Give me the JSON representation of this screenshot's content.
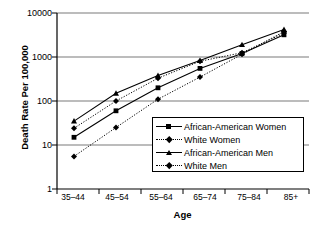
{
  "chart_data": {
    "type": "line",
    "title": "",
    "xlabel": "Age",
    "ylabel": "Death Rate Per 100,000",
    "categories": [
      "35–44",
      "45–54",
      "55–64",
      "65–74",
      "75–84",
      "85+"
    ],
    "yscale": "log",
    "ylim": [
      1,
      10000
    ],
    "ytick_labels": [
      "10000",
      "1000",
      "100",
      "10",
      "1"
    ],
    "ytick_values": [
      10000,
      1000,
      100,
      10,
      1
    ],
    "grid": "horizontal",
    "legend_position": "center-right-inside",
    "series": [
      {
        "name": "African-American Women",
        "marker": "square",
        "line": "solid",
        "values": [
          15,
          60,
          200,
          550,
          1200,
          3200
        ]
      },
      {
        "name": "White Women",
        "marker": "diamond",
        "line": "dotted",
        "values": [
          24,
          100,
          330,
          800,
          1250,
          3500
        ]
      },
      {
        "name": "African-American Men",
        "marker": "triangle",
        "line": "solid",
        "values": [
          35,
          150,
          380,
          830,
          1900,
          4200
        ]
      },
      {
        "name": "White Men",
        "marker": "diamond",
        "line": "dotted",
        "values": [
          5.5,
          25,
          110,
          350,
          1150,
          3800
        ]
      }
    ]
  },
  "axes": {
    "y_title": "Death Rate Per 100,000",
    "x_title": "Age"
  },
  "colors": {
    "ink": "#000000",
    "grid": "#808080",
    "background": "#ffffff"
  }
}
